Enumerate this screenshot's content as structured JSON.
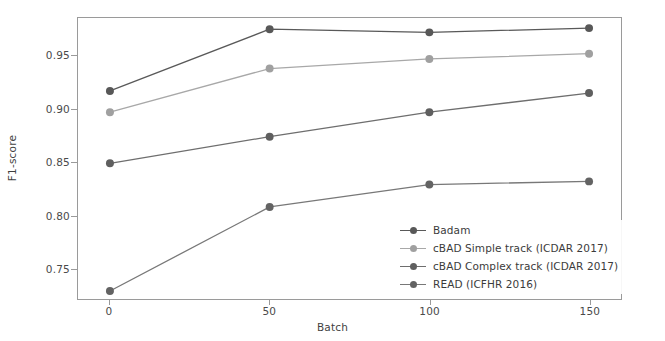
{
  "chart_data": {
    "type": "line",
    "title": "",
    "xlabel": "Batch",
    "ylabel": "F1-score",
    "x": [
      0,
      50,
      100,
      150
    ],
    "xticks": [
      "0",
      "50",
      "100",
      "150"
    ],
    "yticks": [
      "0.75",
      "0.80",
      "0.85",
      "0.90",
      "0.95"
    ],
    "ytick_values": [
      0.75,
      0.8,
      0.85,
      0.9,
      0.95
    ],
    "xlim": [
      -10,
      160
    ],
    "ylim": [
      0.7215,
      0.9855
    ],
    "grid": false,
    "legend_position": "lower right",
    "series": [
      {
        "name": "Badam",
        "values": [
          0.917,
          0.975,
          0.972,
          0.976
        ],
        "color": "#595959",
        "marker_color": "#585858"
      },
      {
        "name": "cBAD Simple track (ICDAR 2017)",
        "values": [
          0.897,
          0.938,
          0.947,
          0.952
        ],
        "color": "#a8a8a8",
        "marker_color": "#a0a0a0"
      },
      {
        "name": "cBAD Complex track (ICDAR 2017)",
        "values": [
          0.849,
          0.874,
          0.897,
          0.915
        ],
        "color": "#6e6e6e",
        "marker_color": "#5f5f5f"
      },
      {
        "name": "READ (ICFHR 2016)",
        "values": [
          0.729,
          0.808,
          0.829,
          0.832
        ],
        "color": "#787878",
        "marker_color": "#636363"
      }
    ]
  },
  "axes": {
    "frame_color": "#9a9a9a",
    "tick_color": "#4a4a4a"
  }
}
